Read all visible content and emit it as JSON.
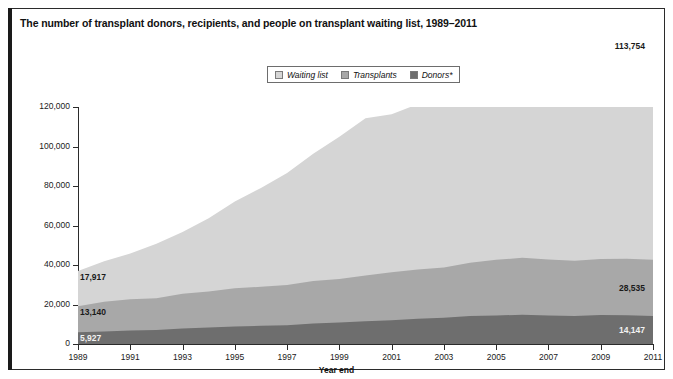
{
  "title": "The number of transplant donors, recipients, and people on transplant waiting list, 1989–2011",
  "legend": {
    "position": "top-center",
    "items": [
      {
        "label": "Waiting list",
        "color": "#d5d5d5",
        "name": "waiting-list"
      },
      {
        "label": "Transplants",
        "color": "#a8a8a8",
        "name": "transplants"
      },
      {
        "label": "Donors*",
        "color": "#6e6e6e",
        "name": "donors"
      }
    ]
  },
  "annotations": {
    "left": [
      {
        "value": "17,917",
        "series": "Waiting list",
        "year": 1989
      },
      {
        "value": "13,140",
        "series": "Transplants",
        "year": 1989
      },
      {
        "value": "5,927",
        "series": "Donors*",
        "year": 1989
      }
    ],
    "right": [
      {
        "value": "113,754",
        "series": "Waiting list",
        "year": 2011
      },
      {
        "value": "28,535",
        "series": "Transplants",
        "year": 2011
      },
      {
        "value": "14,147",
        "series": "Donors*",
        "year": 2011
      }
    ]
  },
  "chart_data": {
    "type": "area",
    "stacked": true,
    "title": "The number of transplant donors, recipients, and people on transplant waiting list, 1989–2011",
    "xlabel": "Year end",
    "ylabel": "Number of people",
    "xlim": [
      1989,
      2011
    ],
    "ylim": [
      0,
      120000
    ],
    "grid": false,
    "legend_position": "top-center",
    "x": [
      1989,
      1990,
      1991,
      1992,
      1993,
      1994,
      1995,
      1996,
      1997,
      1998,
      1999,
      2000,
      2001,
      2002,
      2003,
      2004,
      2005,
      2006,
      2007,
      2008,
      2009,
      2010,
      2011
    ],
    "xticks": [
      1989,
      1991,
      1993,
      1995,
      1997,
      1999,
      2001,
      2003,
      2005,
      2007,
      2009,
      2011
    ],
    "xtick_labels": [
      "1989",
      "1991",
      "1993",
      "1995",
      "1997",
      "1999",
      "2001",
      "2003",
      "2005",
      "2007",
      "2009",
      "2011"
    ],
    "yticks": [
      0,
      20000,
      40000,
      60000,
      80000,
      100000,
      120000
    ],
    "ytick_labels": [
      "0",
      "20,000",
      "40,000",
      "60,000",
      "80,000",
      "100,000",
      "120,000"
    ],
    "series": [
      {
        "name": "Donors*",
        "color": "#6e6e6e",
        "stack_order": 1,
        "values": [
          5927,
          6379,
          6866,
          7091,
          7786,
          8337,
          8854,
          9213,
          9540,
          10360,
          10862,
          11466,
          12072,
          12808,
          13284,
          14152,
          14490,
          14754,
          14400,
          14208,
          14630,
          14506,
          14147
        ]
      },
      {
        "name": "Transplants",
        "color": "#a8a8a8",
        "stack_order": 2,
        "values": [
          13140,
          15004,
          15756,
          16134,
          17628,
          18296,
          19393,
          19723,
          20314,
          21519,
          22026,
          23257,
          24238,
          24903,
          25469,
          27035,
          28115,
          28930,
          28356,
          27963,
          28465,
          28664,
          28535
        ]
      },
      {
        "name": "Waiting list",
        "color": "#d5d5d5",
        "stack_order": 3,
        "values": [
          17917,
          20481,
          23198,
          27563,
          31355,
          37096,
          43937,
          50052,
          56716,
          64423,
          72110,
          79523,
          80048,
          83731,
          86392,
          90258,
          92849,
          95526,
          98882,
          102188,
          106440,
          110244,
          113754
        ]
      }
    ],
    "annotations": [
      {
        "text": "17,917",
        "series": "Waiting list",
        "x": 1989,
        "align": "left"
      },
      {
        "text": "13,140",
        "series": "Transplants",
        "x": 1989,
        "align": "left"
      },
      {
        "text": "5,927",
        "series": "Donors*",
        "x": 1989,
        "align": "left"
      },
      {
        "text": "113,754",
        "series": "Waiting list",
        "x": 2011,
        "align": "right"
      },
      {
        "text": "28,535",
        "series": "Transplants",
        "x": 2011,
        "align": "right"
      },
      {
        "text": "14,147",
        "series": "Donors*",
        "x": 2011,
        "align": "right"
      }
    ]
  },
  "axis": {
    "x_title": "Year end",
    "y_title": "Number of people"
  }
}
